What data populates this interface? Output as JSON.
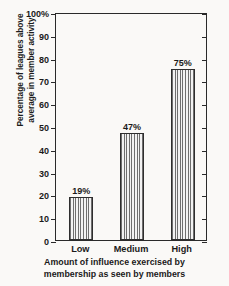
{
  "chart_data": {
    "type": "bar",
    "title": "",
    "categories": [
      "Low",
      "Medium",
      "High"
    ],
    "values": [
      19,
      47,
      75
    ],
    "value_labels": [
      "19%",
      "47%",
      "75%"
    ],
    "xlabel_lines": [
      "Amount of influence exercised by",
      "membership as seen by members"
    ],
    "ylabel_lines": [
      "Percentage of leagues above",
      "average in member activity"
    ],
    "ylim": [
      0,
      100
    ],
    "ytick_values": [
      0,
      10,
      20,
      30,
      40,
      50,
      60,
      70,
      80,
      90,
      100
    ],
    "ytick_labels": [
      "0",
      "10",
      "20",
      "30",
      "40",
      "50",
      "60",
      "70",
      "80",
      "90",
      "100%"
    ],
    "grid": false,
    "legend": false,
    "bar_fill": "vertical-hatch",
    "colors": {
      "background": "#faf9f7",
      "axis": "#2a2a2a",
      "text": "#1a1a1a",
      "bar_stripe_dark": "#6e6e6e",
      "bar_stripe_light": "#f2f2f2",
      "bar_border": "#2e2e2e"
    }
  }
}
